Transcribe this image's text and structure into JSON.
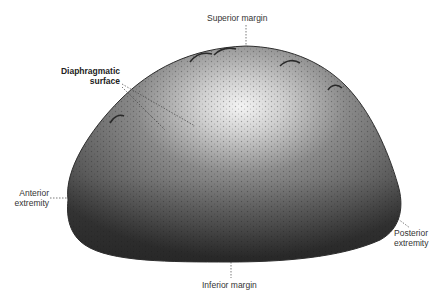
{
  "figure": {
    "colors": {
      "background": "#ffffff",
      "organ_dark": "#3a3a3a",
      "organ_mid": "#6e6e6e",
      "organ_highlight": "#f2f2f2",
      "leader_line": "#444444",
      "label_text": "#333333"
    }
  },
  "labels": {
    "superior_margin": "Superior margin",
    "diaphragmatic_surface_line1": "Diaphragmatic",
    "diaphragmatic_surface_line2": "surface",
    "anterior_extremity_line1": "Anterior",
    "anterior_extremity_line2": "extremity",
    "posterior_extremity_line1": "Posterior",
    "posterior_extremity_line2": "extremity",
    "inferior_margin": "Inferior margin"
  }
}
